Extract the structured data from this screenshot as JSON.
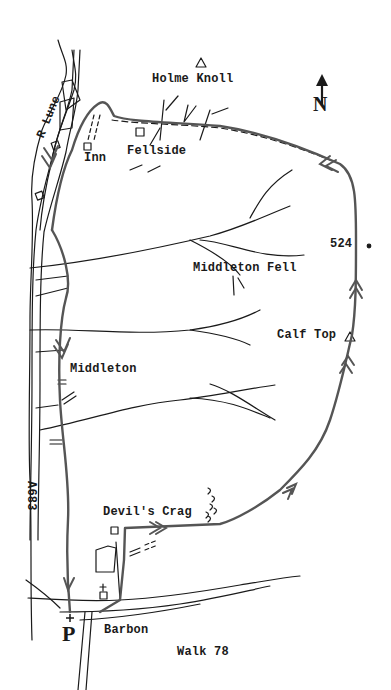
{
  "map": {
    "title": "Walk 78",
    "north_label": "N",
    "parking_label": "P",
    "labels": {
      "holme_knoll": "Holme Knoll",
      "fellside": "Fellside",
      "inn": "Inn",
      "river": "R Lune",
      "middleton_fell": "Middleton Fell",
      "spot_height": "524",
      "calf_top": "Calf Top",
      "middleton": "Middleton",
      "road": "A683",
      "devils_crag": "Devil's Crag",
      "barbon": "Barbon"
    },
    "colors": {
      "ink": "#1a1a1a",
      "route": "#555555",
      "paper": "#ffffff"
    }
  }
}
